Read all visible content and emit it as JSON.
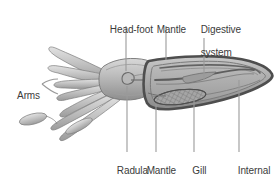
{
  "figure": {
    "type": "anatomical-diagram",
    "background_color": "#ffffff",
    "text_color": "#3b3b3b",
    "leader_line_color": "#8c8c8c",
    "body_outline_color": "#6b6b6b",
    "mantle_outline_color": "#4a4a4a",
    "body_fill_light": "#d6d6d6",
    "body_fill_mid": "#b3b3b3",
    "body_fill_dark": "#8f8f8f",
    "mantle_fill": "#a8a8a8",
    "gill_fill": "#9a9a9a"
  },
  "labels": [
    {
      "id": "head-foot",
      "text": "Head-foot",
      "lines": [
        "Head-foot"
      ],
      "position": "top"
    },
    {
      "id": "mantle",
      "text": "Mantle",
      "lines": [
        "Mantle"
      ],
      "position": "top"
    },
    {
      "id": "digestive-system",
      "text": "Digestive system",
      "lines": [
        "Digestive",
        "system"
      ],
      "position": "top"
    },
    {
      "id": "arms",
      "text": "Arms",
      "lines": [
        "Arms"
      ],
      "position": "left"
    },
    {
      "id": "radula",
      "text": "Radula",
      "lines": [
        "Radula"
      ],
      "position": "bottom"
    },
    {
      "id": "mantle-cavity",
      "text": "Mantle cavity",
      "lines": [
        "Mantle",
        "cavity"
      ],
      "position": "bottom"
    },
    {
      "id": "gill",
      "text": "Gill",
      "lines": [
        "Gill"
      ],
      "position": "bottom"
    },
    {
      "id": "internal-shell",
      "text": "Internal shell",
      "lines": [
        "Internal",
        "shell"
      ],
      "position": "bottom"
    }
  ],
  "label_text": {
    "head_foot": "Head-foot",
    "mantle": "Mantle",
    "digestive_line1": "Digestive",
    "digestive_line2": "system",
    "arms": "Arms",
    "radula": "Radula",
    "mantle_cavity_line1": "Mantle",
    "mantle_cavity_line2": "cavity",
    "gill": "Gill",
    "internal_shell_line1": "Internal",
    "internal_shell_line2": "shell"
  }
}
